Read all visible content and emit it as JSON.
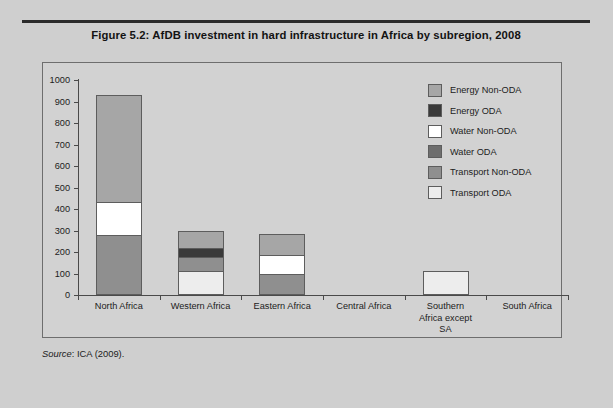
{
  "figure": {
    "title": "Figure 5.2:  AfDB investment in hard infrastructure in Africa by subregion, 2008",
    "source_word": "Source",
    "source_text": ": ICA (2009)."
  },
  "colors": {
    "page_background": "#cfcfcf",
    "panel_background": "#d2d2d2",
    "rule": "#2b2b2b",
    "axis": "#4a4a4a",
    "bar_outline": "#5d5d5d",
    "energy_non_oda": "#a6a6a6",
    "energy_oda": "#3a3a3a",
    "water_non_oda": "#ffffff",
    "water_oda": "#6e6e6e",
    "transport_non_oda": "#8f8f8f",
    "transport_oda": "#ededed"
  },
  "legend": {
    "position": "right",
    "items": [
      {
        "label": "Energy Non-ODA",
        "color": "#a6a6a6"
      },
      {
        "label": "Energy ODA",
        "color": "#3a3a3a"
      },
      {
        "label": "Water Non-ODA",
        "color": "#ffffff"
      },
      {
        "label": "Water ODA",
        "color": "#6e6e6e"
      },
      {
        "label": "Transport Non-ODA",
        "color": "#8f8f8f"
      },
      {
        "label": "Transport ODA",
        "color": "#ededed"
      }
    ]
  },
  "chart_data": {
    "type": "bar",
    "stacked": true,
    "title": "Figure 5.2:  AfDB investment in hard infrastructure in Africa by subregion, 2008",
    "xlabel": "",
    "ylabel": "",
    "ylim": [
      0,
      1000
    ],
    "yticks": [
      0,
      100,
      200,
      300,
      400,
      500,
      600,
      700,
      800,
      900,
      1000
    ],
    "grid": false,
    "categories": [
      "North Africa",
      "Western Africa",
      "Eastern Africa",
      "Central Africa",
      "Southern Africa except SA",
      "South Africa"
    ],
    "category_lines": [
      [
        "North Africa"
      ],
      [
        "Western Africa"
      ],
      [
        "Eastern Africa"
      ],
      [
        "Central Africa"
      ],
      [
        "Southern",
        "Africa except",
        "SA"
      ],
      [
        "South Africa"
      ]
    ],
    "series": [
      {
        "name": "Transport ODA",
        "color": "#ededed",
        "values": [
          0,
          110,
          0,
          0,
          110,
          0
        ]
      },
      {
        "name": "Transport Non-ODA",
        "color": "#8f8f8f",
        "values": [
          280,
          65,
          100,
          0,
          0,
          0
        ]
      },
      {
        "name": "Water ODA",
        "color": "#6e6e6e",
        "values": [
          0,
          0,
          0,
          0,
          0,
          0
        ]
      },
      {
        "name": "Water Non-ODA",
        "color": "#ffffff",
        "values": [
          155,
          0,
          85,
          0,
          0,
          0
        ]
      },
      {
        "name": "Energy ODA",
        "color": "#3a3a3a",
        "values": [
          0,
          45,
          0,
          0,
          0,
          0
        ]
      },
      {
        "name": "Energy Non-ODA",
        "color": "#a6a6a6",
        "values": [
          495,
          80,
          100,
          0,
          0,
          0
        ]
      }
    ],
    "totals": [
      930,
      300,
      285,
      0,
      110,
      0
    ]
  }
}
